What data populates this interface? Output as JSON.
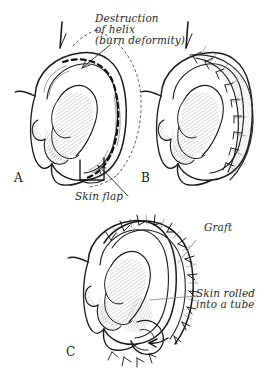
{
  "figure": {
    "style": "pen-and-ink line drawing with hatching",
    "background_color": "#ffffff",
    "ink_color": "#1a1a1a"
  },
  "annotations": {
    "destruction_line1": "Destruction",
    "destruction_line2": "of helix",
    "destruction_line3": "(burn deformity)",
    "skin_flap": "Skin flap",
    "graft": "Graft",
    "skin_rolled_line1": "Skin rolled",
    "skin_rolled_line2": "into a tube"
  },
  "panels": [
    {
      "letter": "A",
      "name": "panel-a-deformity",
      "description": "Ear with destroyed helix, dashed incision line and dotted flap outline"
    },
    {
      "letter": "B",
      "name": "panel-b-flap-sutured",
      "description": "Ear after skin flap elevation with suture line along helix"
    },
    {
      "letter": "C",
      "name": "panel-c-tubed-graft",
      "description": "Ear with skin rolled into a tube forming new helix, sutures around rim"
    }
  ]
}
